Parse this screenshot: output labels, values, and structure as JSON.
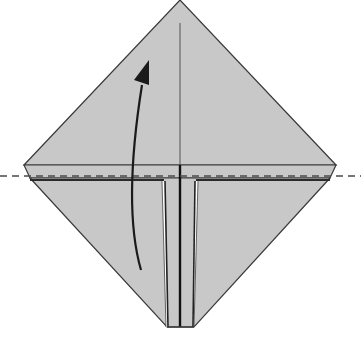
{
  "diagram": {
    "type": "origami-fold-step",
    "colors": {
      "paper": "#c8c8c8",
      "outline": "#3a3a3a",
      "background": "#ffffff",
      "arrow": "#1a1a1a",
      "fold_line_dashed": "#555555",
      "highlight": "#ffffff"
    },
    "elements": {
      "diamond": {
        "top": [
          180,
          0
        ],
        "left": [
          24,
          165
        ],
        "right": [
          336,
          165
        ],
        "bottom_left": [
          167,
          327
        ],
        "bottom_right": [
          194,
          327
        ]
      },
      "fold_line": {
        "style": "dashed",
        "y": 177,
        "x_from": 0,
        "x_to": 361
      },
      "arrow": {
        "direction": "up",
        "curve": "from bottom-left to top"
      }
    }
  },
  "caption": {
    "text": "",
    "note": "caption text is clipped at bottom edge; only glyph tops visible"
  }
}
